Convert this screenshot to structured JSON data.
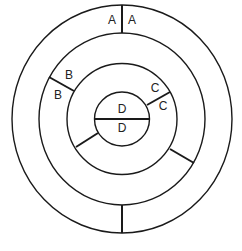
{
  "diagram": {
    "type": "concentric-rings",
    "colors": {
      "stroke": "#1a1a1a",
      "background": "#ffffff",
      "text": "#222222"
    },
    "center": [
      122,
      119
    ],
    "rings": [
      {
        "name": "outer",
        "rx": 110,
        "ry": 114
      },
      {
        "name": "second",
        "rx": 83,
        "ry": 86
      },
      {
        "name": "third",
        "rx": 55,
        "ry": 55.5
      },
      {
        "name": "inner",
        "rx": 27.5,
        "ry": 27
      }
    ],
    "segments": [
      {
        "name": "A-divider-top",
        "x1": 122,
        "y1": 5,
        "x2": 122,
        "y2": 33
      },
      {
        "name": "A-divider-bottom",
        "x1": 122,
        "y1": 205,
        "x2": 122,
        "y2": 233
      },
      {
        "name": "B-divider",
        "x1": 49,
        "y1": 77,
        "x2": 74,
        "y2": 91
      },
      {
        "name": "C-divider",
        "x1": 147,
        "y1": 105,
        "x2": 170,
        "y2": 92
      },
      {
        "name": "lower-right-divider",
        "x1": 170,
        "y1": 149,
        "x2": 194,
        "y2": 163
      },
      {
        "name": "lower-left-divider",
        "x1": 98,
        "y1": 133,
        "x2": 76,
        "y2": 147
      },
      {
        "name": "D-diameter",
        "x1": 95,
        "y1": 119,
        "x2": 150,
        "y2": 119
      }
    ],
    "labels": [
      {
        "text": "A",
        "x": 112,
        "y": 21
      },
      {
        "text": "A",
        "x": 132,
        "y": 21
      },
      {
        "text": "B",
        "x": 69,
        "y": 76
      },
      {
        "text": "B",
        "x": 58,
        "y": 96
      },
      {
        "text": "C",
        "x": 155,
        "y": 89
      },
      {
        "text": "C",
        "x": 163,
        "y": 107
      },
      {
        "text": "D",
        "x": 122,
        "y": 110
      },
      {
        "text": "D",
        "x": 122,
        "y": 129
      }
    ]
  }
}
